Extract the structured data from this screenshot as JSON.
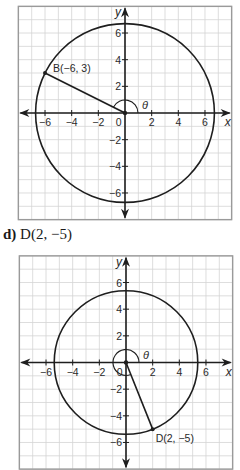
{
  "chart_data": [
    {
      "type": "scatter",
      "title": "",
      "description": "Circle centered at origin through terminal point B, with radius segment and angle theta in standard position",
      "point": {
        "label": "B(−6, 3)",
        "x": -6,
        "y": 3
      },
      "circle": {
        "center": [
          0,
          0
        ],
        "radius": 6.708
      },
      "angle": {
        "label": "θ",
        "start_deg": 0,
        "end_deg": 153.43
      },
      "xlabel": "x",
      "ylabel": "y",
      "xlim": [
        -8,
        8
      ],
      "ylim": [
        -8,
        8
      ],
      "x_ticks": [
        "−6",
        "−4",
        "−2",
        "0",
        "2",
        "4",
        "6"
      ],
      "y_ticks": [
        "6",
        "4",
        "2",
        "−2",
        "−4",
        "−6"
      ],
      "grid": true,
      "grid_step": 1
    },
    {
      "type": "scatter",
      "title": "",
      "part_label": "d)",
      "heading": "D(2, −5)",
      "description": "Circle centered at origin through terminal point D, with radius segment and angle theta in standard position",
      "point": {
        "label": "D(2, −5)",
        "x": 2,
        "y": -5
      },
      "circle": {
        "center": [
          0,
          0
        ],
        "radius": 5.385
      },
      "angle": {
        "label": "θ",
        "start_deg": 0,
        "end_deg": 291.8
      },
      "xlabel": "x",
      "ylabel": "y",
      "xlim": [
        -8,
        8
      ],
      "ylim": [
        -8,
        8
      ],
      "x_ticks": [
        "−6",
        "−4",
        "−2",
        "0",
        "2",
        "4",
        "6"
      ],
      "y_ticks": [
        "6",
        "4",
        "2",
        "−2",
        "−4",
        "−6"
      ],
      "grid": true,
      "grid_step": 1
    }
  ],
  "colors": {
    "grid": "#d4d4d4",
    "frame": "#9a9a9a",
    "ink": "#1e1e1e"
  },
  "part_d": {
    "letter": "d)",
    "text": "D(2, −5)"
  }
}
